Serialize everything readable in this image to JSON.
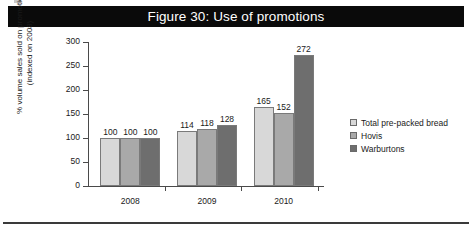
{
  "title": "Figure 30: Use of promotions",
  "footer_rule": true,
  "chart_data": {
    "type": "bar",
    "title": "Figure 30: Use of promotions",
    "categories": [
      "2008",
      "2009",
      "2010"
    ],
    "series": [
      {
        "name": "Total pre-packed bread",
        "values": [
          100,
          114,
          165
        ],
        "color": "#d8d8d8"
      },
      {
        "name": "Hovis",
        "values": [
          100,
          118,
          152
        ],
        "color": "#a9a9a9"
      },
      {
        "name": "Warburtons",
        "values": [
          100,
          128,
          272
        ],
        "color": "#6e6e6e"
      }
    ],
    "xlabel": "",
    "ylabel": "% volume sales sold on promotion (indexed on 2008)",
    "ylabel_lines": [
      "% volume sales sold on promotion",
      "(indexed on 2008)"
    ],
    "ylim": [
      0,
      300
    ],
    "yticks": [
      0,
      50,
      100,
      150,
      200,
      250,
      300
    ],
    "ytick_labels": [
      "0",
      "50",
      "100",
      "150",
      "200",
      "250",
      "300"
    ],
    "grid": false,
    "legend_position": "right",
    "data_labels": true
  }
}
